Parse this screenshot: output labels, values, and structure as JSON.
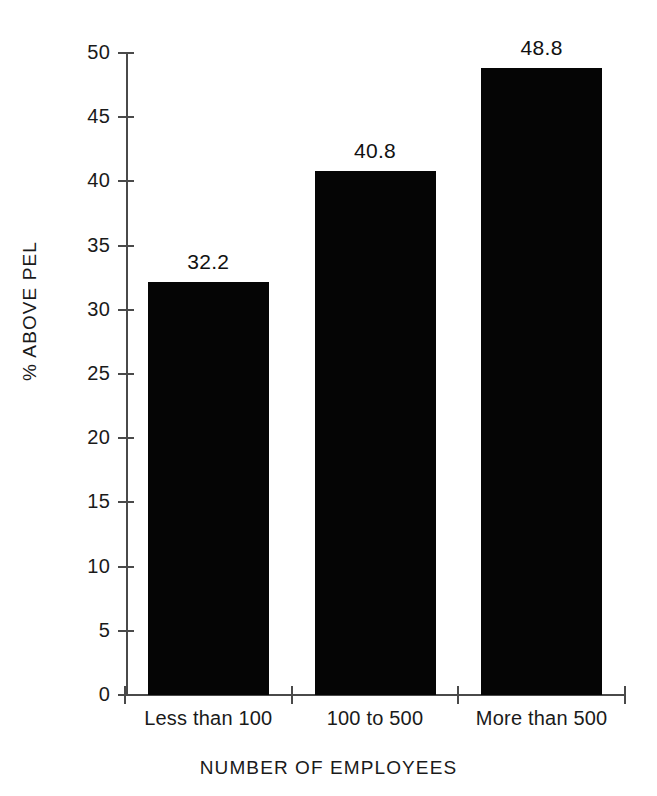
{
  "chart_data": {
    "type": "bar",
    "title": "",
    "subtitle": "",
    "xlabel": "NUMBER OF EMPLOYEES",
    "ylabel": "% ABOVE PEL",
    "categories": [
      "Less than 100",
      "100 to 500",
      "More than 500"
    ],
    "values": [
      32.2,
      40.8,
      48.8
    ],
    "value_labels": [
      "32.2",
      "40.8",
      "48.8"
    ],
    "ylim": [
      0,
      50
    ],
    "ytick_values": [
      0,
      5,
      10,
      15,
      20,
      25,
      30,
      35,
      40,
      45,
      50
    ],
    "ytick_labels": [
      "0",
      "5",
      "10",
      "15",
      "20",
      "25",
      "30",
      "35",
      "40",
      "45",
      "50"
    ],
    "grid": false,
    "legend": false,
    "legend_position": "none",
    "bar_color": "#050505",
    "axis_color": "#4a4a4a",
    "background_color": "#ffffff",
    "text_color": "#1a1a1a"
  }
}
